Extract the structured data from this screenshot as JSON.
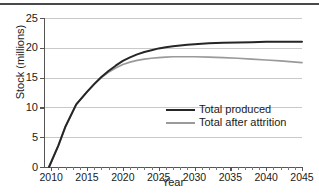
{
  "chart_data": {
    "type": "line",
    "title": "",
    "xlabel": "Year",
    "ylabel": "Stock (millions)",
    "xlim": [
      2009,
      2045
    ],
    "ylim": [
      0,
      25
    ],
    "xticks": [
      2010,
      2015,
      2020,
      2025,
      2030,
      2035,
      2040,
      2045
    ],
    "yticks": [
      0,
      5,
      10,
      15,
      20,
      25
    ],
    "xtick_labels": [
      "2010",
      "2015",
      "2020",
      "2025",
      "2030",
      "2035",
      "2040",
      "2045"
    ],
    "ytick_labels": [
      "0",
      "5",
      "10",
      "15",
      "20",
      "25"
    ],
    "xtick_minor_step": 1,
    "grid": "horizontal",
    "legend_position": "center-right",
    "x": [
      2009.7,
      2011,
      2012,
      2013.5,
      2015,
      2016,
      2017,
      2018,
      2019,
      2020,
      2021,
      2022,
      2023,
      2024,
      2025,
      2026,
      2027,
      2028,
      2029,
      2030,
      2032,
      2034,
      2036,
      2038,
      2040,
      2042,
      2045
    ],
    "series": [
      {
        "name": "Total produced",
        "color": "#262626",
        "values": [
          0,
          3.6,
          6.8,
          10.5,
          12.6,
          13.9,
          15.1,
          16.1,
          17.0,
          17.8,
          18.4,
          18.9,
          19.3,
          19.6,
          19.9,
          20.1,
          20.25,
          20.4,
          20.5,
          20.6,
          20.75,
          20.85,
          20.9,
          20.95,
          21.0,
          21.0,
          21.0
        ]
      },
      {
        "name": "Total after attrition",
        "color": "#9a9a9a",
        "values": [
          0,
          3.6,
          6.8,
          10.5,
          12.6,
          13.9,
          15.0,
          15.9,
          16.6,
          17.2,
          17.6,
          17.9,
          18.1,
          18.25,
          18.35,
          18.45,
          18.5,
          18.5,
          18.5,
          18.5,
          18.45,
          18.35,
          18.25,
          18.1,
          17.95,
          17.8,
          17.5
        ]
      }
    ]
  },
  "legend": {
    "entries": [
      {
        "label": "Total produced",
        "color": "#262626"
      },
      {
        "label": "Total after attrition",
        "color": "#9a9a9a"
      }
    ]
  }
}
